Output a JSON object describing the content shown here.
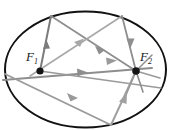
{
  "figure": {
    "type": "geometry-diagram",
    "canvas": {
      "width": 173,
      "height": 130,
      "background": "#ffffff"
    },
    "colors": {
      "ellipse_stroke": "#111111",
      "ray_gray_dark": "#7c7c7c",
      "ray_gray_mid": "#8e8e8e",
      "ray_gray_light": "#a8a8a8",
      "focus_dot": "#151515",
      "label_text": "#1a1a1a"
    },
    "ellipse": {
      "center_x": 85.5,
      "center_y": 69.5,
      "radius_x": 80.5,
      "radius_y": 58.0,
      "stroke_width": 2.0
    },
    "foci": [
      {
        "id": "F1",
        "label_main": "F",
        "label_sub": "1",
        "x": 40,
        "y": 71,
        "dot_radius": 3.6,
        "label_x": 26,
        "label_y": 60
      },
      {
        "id": "F2",
        "label_main": "F",
        "label_sub": "2",
        "x": 136,
        "y": 71,
        "dot_radius": 3.8,
        "label_x": 140,
        "label_y": 60
      }
    ],
    "vertices": [
      {
        "id": "V-top-left",
        "x": 51,
        "y": 16
      },
      {
        "id": "V-top-right",
        "x": 122,
        "y": 16
      },
      {
        "id": "V-left",
        "x": 7,
        "y": 80
      },
      {
        "id": "V-bottom",
        "x": 111,
        "y": 125
      },
      {
        "id": "V-right-lower",
        "x": 161,
        "y": 88
      }
    ],
    "rays": [
      {
        "id": "ray-F1-to-topleft",
        "from": "F1",
        "to": "V-top-left",
        "color": "#7c7c7c",
        "width": 2.0,
        "arrow_at": 0.56,
        "arrow_dir": "up"
      },
      {
        "id": "ray-topleft-to-F2",
        "from": "V-top-left",
        "to": "F2",
        "color": "#8e8e8e",
        "width": 1.8,
        "arrow_at": 0.56,
        "arrow_dir": "down-right"
      },
      {
        "id": "ray-topright-to-F1",
        "from": "V-top-right",
        "to": "F1",
        "color": "#a8a8a8",
        "width": 1.6,
        "arrow_at": 0.42,
        "arrow_dir": "down-left"
      },
      {
        "id": "ray-topright-to-F2",
        "from": "V-top-right",
        "to": "F2",
        "color": "#8e8e8e",
        "width": 1.8,
        "arrow_at": 0.52,
        "arrow_dir": "down"
      },
      {
        "id": "ray-left-to-F2",
        "from": "V-left",
        "to": "F2",
        "color": "#8e8e8e",
        "width": 2.0,
        "arrow_at": 0.56,
        "arrow_dir": "right"
      },
      {
        "id": "ray-left-to-bottom",
        "from": "V-left",
        "to": "V-bottom",
        "color": "#9a9a9a",
        "width": 1.9,
        "arrow_at": 0.55,
        "arrow_dir": "down-right"
      },
      {
        "id": "ray-bottom-to-F2",
        "from": "V-bottom",
        "to": "F2",
        "color": "#a0a0a0",
        "width": 2.0,
        "arrow_at": 0.55,
        "arrow_dir": "up-right"
      },
      {
        "id": "ray-F1-to-rightlower",
        "from": "F1",
        "to": "V-right-lower",
        "color": "#9a9a9a",
        "width": 1.6,
        "arrow_at": 0.5,
        "arrow_dir": "right"
      }
    ],
    "focus_spokes": {
      "description": "short line stubs radiating from F2",
      "count": 4
    },
    "annotations": {
      "caption": "",
      "legend": []
    }
  }
}
